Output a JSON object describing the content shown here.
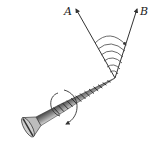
{
  "diagram": {
    "labels": {
      "vector_a": "A",
      "vector_b": "B"
    },
    "arc_count": 6,
    "colors": {
      "line": "#333333",
      "screw_body": "#9a9a9a",
      "screw_head": "#c8c8c8",
      "background": "#ffffff"
    }
  }
}
